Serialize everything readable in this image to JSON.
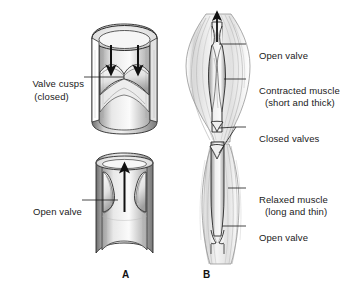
{
  "figure": {
    "background_color": "#ffffff",
    "ink_color": "#1a1a1a",
    "style": "grayscale pen-and-ink anatomical illustration"
  },
  "panels": [
    {
      "letter": "A",
      "name": "panel-a",
      "description": "Cut-away vein segment showing valve cusps closed and valve open"
    },
    {
      "letter": "B",
      "name": "panel-b",
      "description": "Vein within skeletal muscle showing contracted and relaxed muscle"
    }
  ],
  "labels": {
    "valve_cusps_line1": "Valve cusps",
    "valve_cusps_line2": "(closed)",
    "open_valve_left": "Open valve",
    "open_valve_top_right": "Open valve",
    "contracted_muscle_line1": "Contracted muscle",
    "contracted_muscle_line2": "(short and thick)",
    "closed_valves": "Closed valves",
    "relaxed_muscle_line1": "Relaxed muscle",
    "relaxed_muscle_line2": "(long and thin)",
    "open_valve_bottom_right": "Open valve"
  },
  "arrows": {
    "downward_flow_count": 2,
    "upward_flow_count": 1,
    "upward_flow_b_count": 1,
    "meaning_down": "blood pressing down onto closed cusps",
    "meaning_up": "blood flow upward through open valve"
  }
}
